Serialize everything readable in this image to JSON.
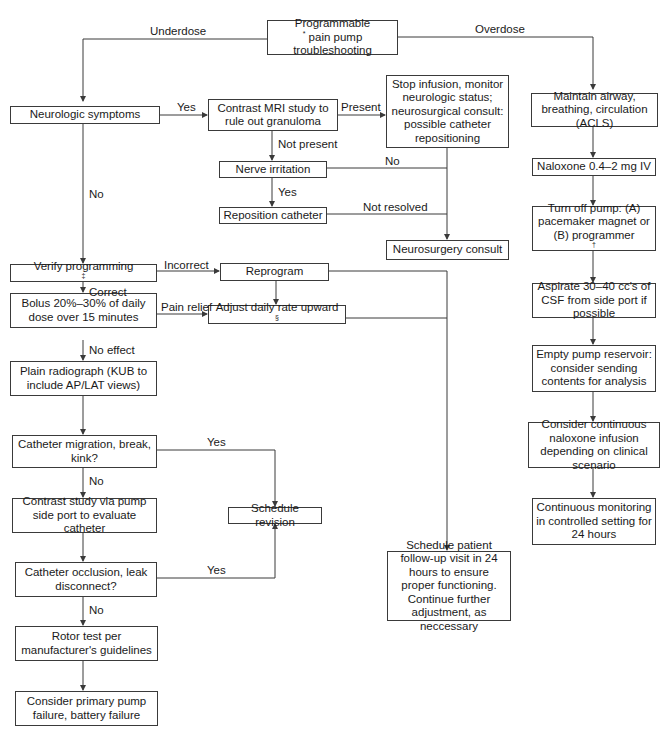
{
  "nodes": {
    "start": {
      "text": "Programmable",
      "sup": "*",
      "text2": " pain pump troubleshooting"
    },
    "neuro_symptoms": {
      "text": "Neurologic symptoms"
    },
    "contrast_mri": {
      "text": "Contrast MRI study to rule out granuloma"
    },
    "stop_infusion": {
      "text": "Stop infusion, monitor neurologic status; neurosurgical consult: possible catheter repositioning"
    },
    "nerve_irritation": {
      "text": "Nerve irritation"
    },
    "reposition_catheter": {
      "text": "Reposition catheter"
    },
    "neurosurgery_consult": {
      "text": "Neurosurgery consult"
    },
    "verify_programming": {
      "text": "Verify programming",
      "sup": "‡"
    },
    "reprogram": {
      "text": "Reprogram"
    },
    "bolus": {
      "text": "Bolus 20%–30% of daily dose over 15 minutes"
    },
    "adjust_rate": {
      "text": "Adjust daily rate upward",
      "sup": "§"
    },
    "plain_radiograph": {
      "text": "Plain radiograph (KUB to include AP/LAT views)"
    },
    "catheter_migration": {
      "text": "Catheter migration, break, kink?"
    },
    "contrast_study": {
      "text": "Contrast study via pump side port to evaluate catheter"
    },
    "schedule_revision": {
      "text": "Schedule revision"
    },
    "catheter_occlusion": {
      "text": "Catheter occlusion, leak disconnect?"
    },
    "rotor_test": {
      "text": "Rotor test per manufacturer's guidelines"
    },
    "primary_failure": {
      "text": "Consider primary pump failure, battery failure"
    },
    "follow_up": {
      "text": "Schedule patient follow-up visit in 24 hours to ensure proper functioning. Continue further adjustment, as neccessary"
    },
    "maintain_airway": {
      "text": "Maintain airway, breathing, circulation (ACLS)"
    },
    "naloxone": {
      "text": "Naloxone 0.4–2 mg IV"
    },
    "turn_off_pump": {
      "text": "Turn off pump: (A) pacemaker magnet or (B) programmer",
      "sup": "†"
    },
    "aspirate": {
      "text": "Aspirate 30–40 cc's of CSF from side port if possible"
    },
    "empty_reservoir": {
      "text": "Empty pump reservoir: consider sending contents for analysis"
    },
    "continuous_naloxone": {
      "text": "Consider continuous naloxone infusion depending on clinical scenario"
    },
    "continuous_monitoring": {
      "text": "Continuous monitoring in controlled setting for 24 hours"
    }
  },
  "edge_labels": {
    "underdose": "Underdose",
    "overdose": "Overdose",
    "neuro_yes": "Yes",
    "neuro_no": "No",
    "mri_present": "Present",
    "mri_not_present": "Not present",
    "nerve_no": "No",
    "nerve_yes": "Yes",
    "not_resolved": "Not resolved",
    "incorrect": "Incorrect",
    "correct": "Correct",
    "pain_relief": "Pain relief",
    "no_effect": "No effect",
    "migration_yes": "Yes",
    "migration_no": "No",
    "occlusion_yes": "Yes",
    "occlusion_no": "No"
  }
}
